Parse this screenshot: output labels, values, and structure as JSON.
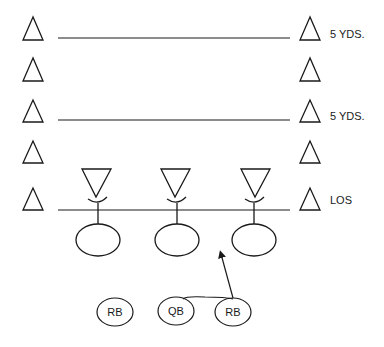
{
  "diagram": {
    "type": "football-play-diagram",
    "stroke_color": "#1a1a1a",
    "background": "#ffffff",
    "yard_labels": [
      {
        "row": 0,
        "text": "5 YDS."
      },
      {
        "row": 2,
        "text": "5 YDS."
      },
      {
        "row": 4,
        "text": "LOS"
      }
    ],
    "cone_rows": 5,
    "yard_lines": [
      {
        "name": "yard-line-10"
      },
      {
        "name": "yard-line-5"
      },
      {
        "name": "line-of-scrimmage"
      }
    ],
    "defenders": [
      {
        "name": "defender-left",
        "symbol": "inverted-triangle"
      },
      {
        "name": "defender-middle",
        "symbol": "inverted-triangle"
      },
      {
        "name": "defender-right",
        "symbol": "inverted-triangle"
      }
    ],
    "linemen": [
      {
        "name": "lineman-left",
        "label": ""
      },
      {
        "name": "lineman-center",
        "label": ""
      },
      {
        "name": "lineman-right",
        "label": ""
      }
    ],
    "backs": [
      {
        "name": "running-back-left",
        "label": "RB"
      },
      {
        "name": "quarterback",
        "label": "QB"
      },
      {
        "name": "running-back-right",
        "label": "RB"
      }
    ],
    "route": {
      "name": "handoff-path-arrow",
      "description": "QB hands off to right RB who runs up the gap between center and right lineman"
    }
  }
}
